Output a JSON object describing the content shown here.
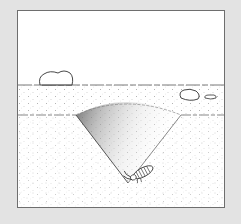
{
  "figure": {
    "subject": "antlion pit cross-section",
    "elements": {
      "sky": "sky",
      "surface_layer": "sand-surface",
      "subsurface": "sand-subsurface",
      "pit": "conical-pit",
      "larva": "antlion-larva",
      "rocks": [
        "rock-large-left",
        "rock-medium-right",
        "rock-small-right"
      ]
    },
    "colors": {
      "background": "#e3e3e3",
      "panel": "#ffffff",
      "border": "#6e6e6e",
      "ink": "#333333",
      "stipple": "#9a9a9a"
    }
  }
}
